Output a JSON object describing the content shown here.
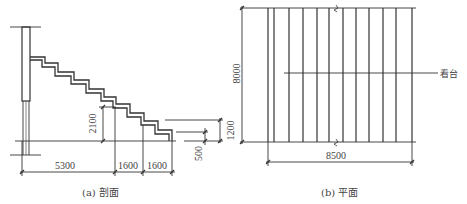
{
  "figure": {
    "section": {
      "caption": "(a) 剖面",
      "dimensions": {
        "bay_main": "5300",
        "bay_2": "1600",
        "bay_3": "1600",
        "rise": "2100",
        "right_small": "500",
        "right_large": "1200"
      }
    },
    "plan": {
      "caption": "(b) 平面",
      "label": "看台",
      "dimensions": {
        "depth": "8000",
        "width": "8500",
        "left_partial": "1200"
      }
    }
  },
  "colors": {
    "line": "#333333",
    "background": "#ffffff"
  }
}
